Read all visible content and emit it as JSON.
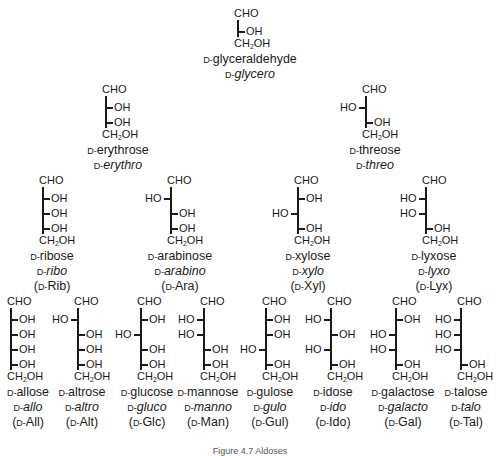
{
  "figure": {
    "caption": "Figure 4.7 Aldoses",
    "labels": {
      "top": "CHO",
      "bottom_pre": "CH",
      "bottom_sub": "2",
      "bottom_post": "OH",
      "oh": "OH",
      "ho": "HO",
      "d": "D-"
    }
  },
  "molecules": [
    {
      "id": "glyceraldehyde",
      "name": "glyceraldehyde",
      "prefix": "glycero",
      "abbr": null,
      "config": [
        "R"
      ]
    },
    {
      "id": "erythrose",
      "name": "erythrose",
      "prefix": "erythro",
      "abbr": null,
      "config": [
        "R",
        "R"
      ]
    },
    {
      "id": "threose",
      "name": "threose",
      "prefix": "threo",
      "abbr": null,
      "config": [
        "L",
        "R"
      ]
    },
    {
      "id": "ribose",
      "name": "ribose",
      "prefix": "ribo",
      "abbr": "Rib",
      "config": [
        "R",
        "R",
        "R"
      ]
    },
    {
      "id": "arabinose",
      "name": "arabinose",
      "prefix": "arabino",
      "abbr": "Ara",
      "config": [
        "L",
        "R",
        "R"
      ]
    },
    {
      "id": "xylose",
      "name": "xylose",
      "prefix": "xylo",
      "abbr": "Xyl",
      "config": [
        "R",
        "L",
        "R"
      ]
    },
    {
      "id": "lyxose",
      "name": "lyxose",
      "prefix": "lyxo",
      "abbr": "Lyx",
      "config": [
        "L",
        "L",
        "R"
      ]
    },
    {
      "id": "allose",
      "name": "allose",
      "prefix": "allo",
      "abbr": "All",
      "config": [
        "R",
        "R",
        "R",
        "R"
      ]
    },
    {
      "id": "altrose",
      "name": "altrose",
      "prefix": "altro",
      "abbr": "Alt",
      "config": [
        "L",
        "R",
        "R",
        "R"
      ]
    },
    {
      "id": "glucose",
      "name": "glucose",
      "prefix": "gluco",
      "abbr": "Glc",
      "config": [
        "R",
        "L",
        "R",
        "R"
      ]
    },
    {
      "id": "mannose",
      "name": "mannose",
      "prefix": "manno",
      "abbr": "Man",
      "config": [
        "L",
        "L",
        "R",
        "R"
      ]
    },
    {
      "id": "gulose",
      "name": "gulose",
      "prefix": "gulo",
      "abbr": "Gul",
      "config": [
        "R",
        "R",
        "L",
        "R"
      ]
    },
    {
      "id": "idose",
      "name": "idose",
      "prefix": "ido",
      "abbr": "Ido",
      "config": [
        "L",
        "R",
        "L",
        "R"
      ]
    },
    {
      "id": "galactose",
      "name": "galactose",
      "prefix": "galacto",
      "abbr": "Gal",
      "config": [
        "R",
        "L",
        "L",
        "R"
      ]
    },
    {
      "id": "talose",
      "name": "talose",
      "prefix": "talo",
      "abbr": "Tal",
      "config": [
        "L",
        "L",
        "L",
        "R"
      ]
    }
  ],
  "layout": [
    {
      "id": "glyceraldehyde",
      "x": 237,
      "y": 8,
      "label_x": 250
    },
    {
      "id": "erythrose",
      "x": 105,
      "y": 84,
      "label_x": 118
    },
    {
      "id": "threose",
      "x": 365,
      "y": 84,
      "label_x": 375
    },
    {
      "id": "ribose",
      "x": 42,
      "y": 175,
      "label_x": 52
    },
    {
      "id": "arabinose",
      "x": 170,
      "y": 175,
      "label_x": 180
    },
    {
      "id": "xylose",
      "x": 297,
      "y": 175,
      "label_x": 308
    },
    {
      "id": "lyxose",
      "x": 425,
      "y": 175,
      "label_x": 434
    },
    {
      "id": "allose",
      "x": 10,
      "y": 296,
      "label_x": 28
    },
    {
      "id": "altrose",
      "x": 77,
      "y": 296,
      "label_x": 82
    },
    {
      "id": "glucose",
      "x": 140,
      "y": 296,
      "label_x": 147
    },
    {
      "id": "mannose",
      "x": 203,
      "y": 296,
      "label_x": 208
    },
    {
      "id": "gulose",
      "x": 265,
      "y": 296,
      "label_x": 270
    },
    {
      "id": "idose",
      "x": 330,
      "y": 296,
      "label_x": 333
    },
    {
      "id": "galactose",
      "x": 395,
      "y": 296,
      "label_x": 403
    },
    {
      "id": "talose",
      "x": 460,
      "y": 296,
      "label_x": 466
    }
  ]
}
